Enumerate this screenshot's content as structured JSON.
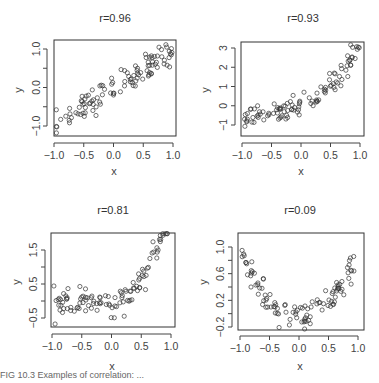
{
  "chart_data": [
    {
      "type": "scatter",
      "title": "r=0.96",
      "xlabel": "x",
      "ylabel": "y",
      "xlim": [
        -1.0,
        1.0
      ],
      "ylim": [
        -1.2,
        1.25
      ],
      "xticks": [
        -1.0,
        -0.5,
        0.0,
        0.5,
        1.0
      ],
      "xtick_labels": [
        "-1.0",
        "-0.5",
        "0.0",
        "0.5",
        "1.0"
      ],
      "yticks": [
        -1.0,
        -0.5,
        0.0,
        0.5,
        1.0
      ],
      "ytick_labels": [
        "-1.0",
        "",
        "0.0",
        "",
        "1.0"
      ],
      "relationship": "linear, y ≈ x + noise",
      "grid": false
    },
    {
      "type": "scatter",
      "title": "r=0.93",
      "xlabel": "x",
      "ylabel": "y",
      "xlim": [
        -1.0,
        1.0
      ],
      "ylim": [
        -1.6,
        3.3
      ],
      "xticks": [
        -1.0,
        -0.5,
        0.0,
        0.5,
        1.0
      ],
      "xtick_labels": [
        "-1.0",
        "-0.5",
        "0.0",
        "0.5",
        "1.0"
      ],
      "yticks": [
        -1,
        0,
        1,
        2,
        3
      ],
      "ytick_labels": [
        "-1",
        "0",
        "1",
        "2",
        "3"
      ],
      "relationship": "convex increasing (exponential-like) + noise",
      "grid": false
    },
    {
      "type": "scatter",
      "title": "r=0.81",
      "xlabel": "x",
      "ylabel": "y",
      "xlim": [
        -1.0,
        1.0
      ],
      "ylim": [
        -0.75,
        2.0
      ],
      "xticks": [
        -1.0,
        -0.5,
        0.0,
        0.5,
        1.0
      ],
      "xtick_labels": [
        "-1.0",
        "-0.5",
        "0.0",
        "0.5",
        "1.0"
      ],
      "yticks": [
        -0.5,
        0.0,
        0.5,
        1.0,
        1.5
      ],
      "ytick_labels": [
        "-0.5",
        "",
        "0.5",
        "",
        "1.5"
      ],
      "relationship": "flat then sharply rising (cubic/exponential-like) + noise",
      "grid": false
    },
    {
      "type": "scatter",
      "title": "r=0.09",
      "xlabel": "x",
      "ylabel": "y",
      "xlim": [
        -1.0,
        1.0
      ],
      "ylim": [
        -0.25,
        1.15
      ],
      "xticks": [
        -1.0,
        -0.5,
        0.0,
        0.5,
        1.0
      ],
      "xtick_labels": [
        "-1.0",
        "-0.5",
        "0.0",
        "0.5",
        "1.0"
      ],
      "yticks": [
        -0.2,
        0.0,
        0.2,
        0.4,
        0.6,
        0.8,
        1.0
      ],
      "ytick_labels": [
        "-0.2",
        "",
        "0.2",
        "",
        "0.6",
        "",
        "1.0"
      ],
      "relationship": "U-shaped, y ≈ x^2 + noise",
      "grid": false
    }
  ],
  "panels": [
    {
      "title": "r=0.96",
      "xlabel": "x",
      "ylabel": "y"
    },
    {
      "title": "r=0.93",
      "xlabel": "x",
      "ylabel": "y"
    },
    {
      "title": "r=0.81",
      "xlabel": "x",
      "ylabel": "y"
    },
    {
      "title": "r=0.09",
      "xlabel": "x",
      "ylabel": "y"
    }
  ],
  "caption": "FIG 10.3  Examples of correlation: ..."
}
